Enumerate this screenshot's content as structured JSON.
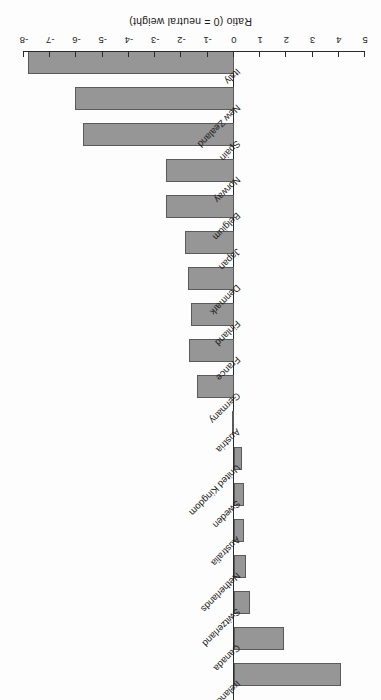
{
  "chart_data": {
    "type": "bar",
    "orientation": "horizontal",
    "title": "",
    "xlabel": "Ratio  (0 = neutral weight)",
    "ylabel": "",
    "xlim": [
      5,
      -8
    ],
    "xticks": [
      "5",
      "4",
      "3",
      "2",
      "1",
      "0",
      "-1",
      "-2",
      "-3",
      "-4",
      "-5",
      "-6",
      "-7",
      "-8"
    ],
    "grid": false,
    "legend": null,
    "bar_color": "#969696",
    "bar_edge_color": "#5a5a5a",
    "axis_color": "#2a2a2a",
    "categories": [
      "Ireland",
      "Canada",
      "Switzerland",
      "Netherlands",
      "Australia",
      "Sweden",
      "United Kingdom",
      "Austria",
      "Germany",
      "France",
      "Finland",
      "Denmark",
      "Japan",
      "Belgium",
      "Norway",
      "Spain",
      "New Zealand",
      "Italy"
    ],
    "values": [
      4.1,
      1.9,
      0.6,
      0.45,
      0.4,
      0.38,
      0.3,
      -0.05,
      -1.4,
      -1.7,
      -1.65,
      -1.75,
      -1.85,
      -2.6,
      -2.6,
      -5.75,
      -6.05,
      -7.85
    ]
  },
  "page": {
    "bleed_text": ""
  }
}
